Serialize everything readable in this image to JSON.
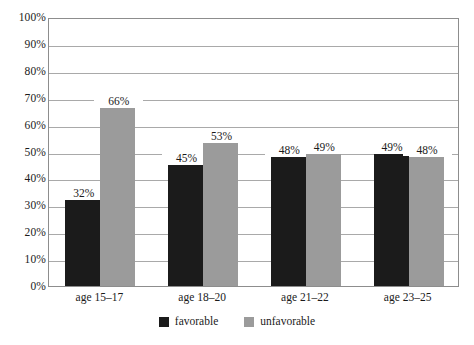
{
  "chart_data": {
    "type": "bar",
    "title": "",
    "subtitle": "",
    "xlabel": "",
    "ylabel": "",
    "ylim": [
      0,
      100
    ],
    "y_tick_labels": [
      "100%",
      "90%",
      "80%",
      "70%",
      "60%",
      "50%",
      "40%",
      "30%",
      "20%",
      "10%",
      "0%"
    ],
    "y_ticks": [
      100,
      90,
      80,
      70,
      60,
      50,
      40,
      30,
      20,
      10,
      0
    ],
    "grid": true,
    "legend_position": "bottom-center",
    "categories": [
      "age 15–17",
      "age 18–20",
      "age 21–22",
      "age 23–25"
    ],
    "series": [
      {
        "name": "favorable",
        "color": "#1b1b1b",
        "values": [
          32,
          45,
          48,
          49
        ],
        "labels": [
          "32%",
          "45%",
          "48%",
          "49%"
        ]
      },
      {
        "name": "unfavorable",
        "color": "#9b9b9b",
        "values": [
          66,
          53,
          49,
          48
        ],
        "labels": [
          "66%",
          "53%",
          "49%",
          "48%"
        ]
      }
    ]
  },
  "legend": {
    "items": [
      {
        "label": "favorable",
        "color": "#1b1b1b"
      },
      {
        "label": "unfavorable",
        "color": "#9b9b9b"
      }
    ]
  },
  "axis": {
    "y": {
      "labels": [
        {
          "text": "100%",
          "value": 100
        },
        {
          "text": "90%",
          "value": 90
        },
        {
          "text": "80%",
          "value": 80
        },
        {
          "text": "70%",
          "value": 70
        },
        {
          "text": "60%",
          "value": 60
        },
        {
          "text": "50%",
          "value": 50
        },
        {
          "text": "40%",
          "value": 40
        },
        {
          "text": "30%",
          "value": 30
        },
        {
          "text": "20%",
          "value": 20
        },
        {
          "text": "10%",
          "value": 10
        },
        {
          "text": "0%",
          "value": 0
        }
      ]
    },
    "x": {
      "labels": [
        {
          "text": "age 15–17"
        },
        {
          "text": "age 18–20"
        },
        {
          "text": "age 21–22"
        },
        {
          "text": "age 23–25"
        }
      ]
    }
  },
  "colors": {
    "favorable": "#1b1b1b",
    "unfavorable": "#9b9b9b",
    "gridline": "#a9a9a9",
    "frame": "#8d8d8d",
    "background": "#ffffff",
    "text": "#1b1b1b"
  }
}
